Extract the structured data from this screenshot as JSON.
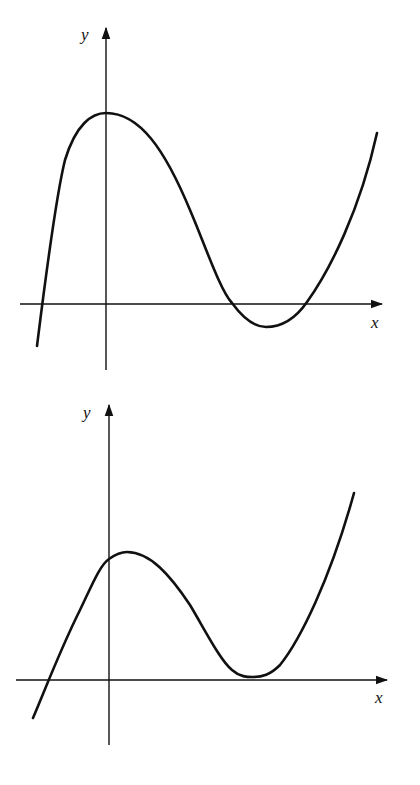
{
  "figure": {
    "stroke_color": "#111111",
    "background": "#ffffff"
  },
  "graphs": [
    {
      "id": "top",
      "x_axis_label": "x",
      "y_axis_label": "y",
      "curve_description": "Local maximum on the y-axis, crosses x-axis three times, local minimum below x-axis"
    },
    {
      "id": "bottom",
      "x_axis_label": "x",
      "y_axis_label": "y",
      "curve_description": "Local maximum just right of y-axis, local minimum tangent to x-axis (double root)"
    }
  ]
}
